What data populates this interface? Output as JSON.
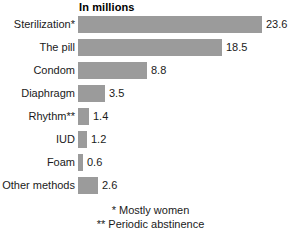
{
  "chart_data": {
    "type": "bar",
    "orientation": "horizontal",
    "title": "In millions",
    "xlabel": "",
    "ylabel": "",
    "categories": [
      "Sterilization*",
      "The pill",
      "Condom",
      "Diaphragm",
      "Rhythm**",
      "IUD",
      "Foam",
      "Other methods"
    ],
    "values": [
      23.6,
      18.5,
      8.8,
      3.5,
      1.4,
      1.2,
      0.6,
      2.6
    ],
    "value_labels": [
      "23.6",
      "18.5",
      "8.8",
      "3.5",
      "1.4",
      "1.2",
      "0.6",
      "2.6"
    ],
    "xlim": [
      0,
      23.6
    ],
    "grid": false,
    "legend": null,
    "bar_color": "#9b9b9b",
    "background_color": "#ffffff",
    "text_color": "#1a1a1a"
  },
  "footnotes": [
    "* Mostly women",
    "** Periodic abstinence"
  ]
}
